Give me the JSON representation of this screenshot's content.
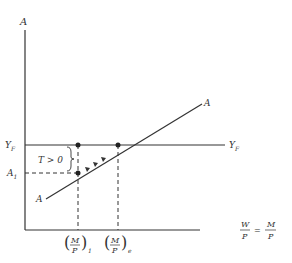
{
  "diagram": {
    "axes": {
      "y_label": "A",
      "x_label_left_num": "W",
      "x_label_left_den": "P",
      "x_label_eq": "=",
      "x_label_right_num": "M",
      "x_label_right_den": "P"
    },
    "lines": {
      "full_employment": {
        "label_left": "Y",
        "label_left_sub": "F",
        "label_right": "Y",
        "label_right_sub": "F"
      },
      "aggregate": {
        "label_top": "A",
        "label_bottom": "A"
      }
    },
    "levels": {
      "a1_label": "A",
      "a1_sub": "1",
      "gap_label": "T > 0"
    },
    "ticks": [
      {
        "num": "M",
        "den": "P",
        "sub": "1"
      },
      {
        "num": "M",
        "den": "P",
        "sub": "e"
      }
    ],
    "colors": {
      "line": "#333333",
      "background": "#ffffff"
    }
  }
}
